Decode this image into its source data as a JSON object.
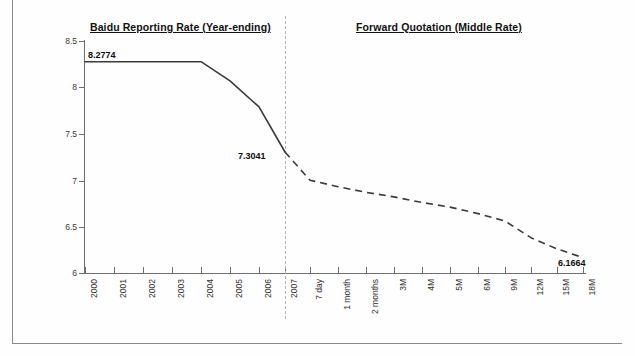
{
  "chart_data": {
    "type": "line",
    "title": "",
    "xlabel": "",
    "ylabel": "",
    "ylim": [
      6,
      8.5
    ],
    "yticks": [
      8.5,
      8,
      7.5,
      7,
      6.5,
      6
    ],
    "ytick_labels": [
      "8.5",
      "8",
      "7.5",
      "7",
      "6.5",
      "6"
    ],
    "grid": false,
    "legend": "none",
    "panels": [
      {
        "name": "historical",
        "title": "Baidu Reporting Rate (Year-ending)",
        "line_style": "solid",
        "categories": [
          "2000",
          "2001",
          "2002",
          "2003",
          "2004",
          "2005",
          "2006",
          "2007"
        ],
        "values": [
          8.2774,
          8.2774,
          8.2774,
          8.2774,
          8.2774,
          8.07,
          7.79,
          7.3041
        ]
      },
      {
        "name": "forward",
        "title": "Forward Quotation (Middle Rate)",
        "line_style": "dashed",
        "categories": [
          "7 day",
          "1 month",
          "2 months",
          "3M",
          "4M",
          "5M",
          "6M",
          "9M",
          "12M",
          "15M",
          "18M"
        ],
        "values": [
          7.0,
          6.93,
          6.87,
          6.82,
          6.76,
          6.71,
          6.64,
          6.56,
          6.38,
          6.26,
          6.1664
        ]
      }
    ],
    "annotations": [
      {
        "name": "start-value",
        "text": "8.2774",
        "series": "historical",
        "x": "2000",
        "y": 8.2774
      },
      {
        "name": "handoff-value",
        "text": "7.3041",
        "series": "historical",
        "x": "2007",
        "y": 7.3041
      },
      {
        "name": "end-value",
        "text": "6.1664",
        "series": "forward",
        "x": "18M",
        "y": 6.1664
      }
    ],
    "divider": {
      "name": "panel-divider",
      "style": "dashed",
      "after_category": "2007"
    },
    "colors": {
      "line": "#3a3a3a",
      "axis": "#6f6f6f",
      "text": "#1a1a1a",
      "divider": "#b3b3b3",
      "background": "#fefefe"
    }
  }
}
